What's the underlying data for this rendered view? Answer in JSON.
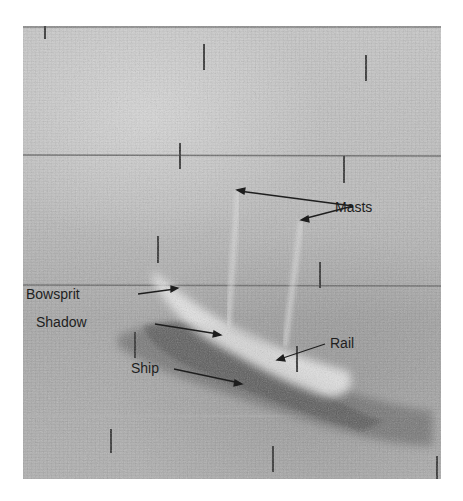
{
  "figure": {
    "type": "sonar-image",
    "labels": {
      "masts": "Masts",
      "bowsprit": "Bowsprit",
      "shadow": "Shadow",
      "rail": "Rail",
      "ship": "Ship"
    },
    "colors": {
      "background": "#bdbdbd",
      "shadow_dark": "#5a5a5a",
      "highlight": "#e8e8e8",
      "text": "#1e1e1e"
    }
  }
}
